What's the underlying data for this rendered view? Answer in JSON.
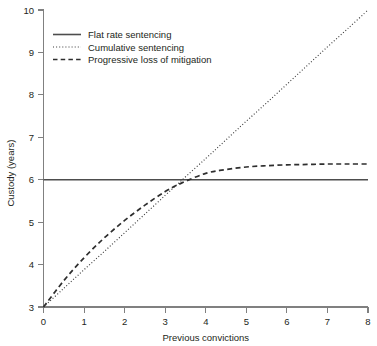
{
  "chart_data": {
    "type": "line",
    "title": "",
    "xlabel": "Previous convictions",
    "ylabel": "Custody (years)",
    "xlim": [
      0,
      8
    ],
    "ylim": [
      3,
      10
    ],
    "xticks": [
      "0",
      "1",
      "2",
      "3",
      "4",
      "5",
      "6",
      "7",
      "8"
    ],
    "yticks": [
      "3",
      "4",
      "5",
      "6",
      "7",
      "8",
      "9",
      "10"
    ],
    "grid": false,
    "legend_position": "top-left",
    "x": [
      0,
      0.5,
      1,
      1.5,
      2,
      2.5,
      3,
      3.4,
      4,
      4.5,
      5,
      5.5,
      6,
      6.5,
      7,
      7.5,
      8
    ],
    "series": [
      {
        "name": "Flat rate sentencing",
        "style": "solid",
        "color": "#4d4d4d",
        "values": [
          6,
          6,
          6,
          6,
          6,
          6,
          6,
          6,
          6,
          6,
          6,
          6,
          6,
          6,
          6,
          6,
          6
        ]
      },
      {
        "name": "Cumulative sentencing",
        "style": "dotted",
        "color": "#3a3a3a",
        "values": [
          3,
          3.44,
          3.88,
          4.31,
          4.75,
          5.19,
          5.63,
          5.98,
          6.5,
          6.94,
          7.38,
          7.81,
          8.25,
          8.69,
          9.13,
          9.56,
          10
        ]
      },
      {
        "name": "Progressive loss of mitigation",
        "style": "dashed",
        "color": "#2e2e2e",
        "values": [
          3,
          3.62,
          4.16,
          4.63,
          5.04,
          5.4,
          5.72,
          5.92,
          6.15,
          6.24,
          6.3,
          6.33,
          6.35,
          6.36,
          6.37,
          6.37,
          6.37
        ]
      }
    ],
    "annotations": [
      {
        "text": "intersection of all three series",
        "x": 3.4,
        "y": 6
      }
    ]
  },
  "legend": {
    "items": [
      {
        "label": "Flat rate sentencing",
        "sample": "solid-line-sample"
      },
      {
        "label": "Cumulative sentencing",
        "sample": "dotted-line-sample"
      },
      {
        "label": "Progressive loss of mitigation",
        "sample": "dashed-line-sample"
      }
    ]
  },
  "axes": {
    "x_title": "Previous convictions",
    "y_title": "Custody (years)",
    "x_tick_labels": [
      "0",
      "1",
      "2",
      "3",
      "4",
      "5",
      "6",
      "7",
      "8"
    ],
    "y_tick_labels": [
      "3",
      "4",
      "5",
      "6",
      "7",
      "8",
      "9",
      "10"
    ]
  },
  "colors": {
    "axis": "#808080",
    "text": "#231f20",
    "background": "#ffffff",
    "series_solid": "#4d4d4d",
    "series_dotted": "#3a3a3a",
    "series_dashed": "#2e2e2e"
  }
}
